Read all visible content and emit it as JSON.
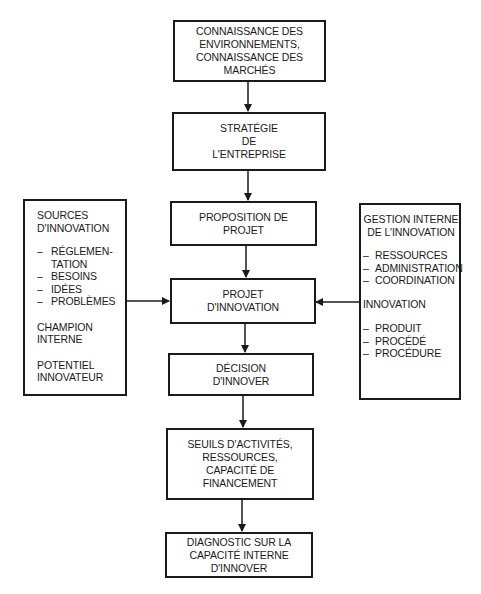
{
  "diagram": {
    "nodes": {
      "connaissance": {
        "lines": [
          "CONNAISSANCE DES",
          "ENVIRONNEMENTS,",
          "CONNAISSANCE DES",
          "MARCHÉS"
        ]
      },
      "strategie": {
        "lines": [
          "STRATÉGIE",
          "DE",
          "L'ENTREPRISE"
        ]
      },
      "proposition": {
        "lines": [
          "PROPOSITION DE",
          "PROJET"
        ]
      },
      "projet": {
        "lines": [
          "PROJET",
          "D'INNOVATION"
        ]
      },
      "decision": {
        "lines": [
          "DÉCISION",
          "D'INNOVER"
        ]
      },
      "seuils": {
        "lines": [
          "SEUILS D'ACTIVITÉS,",
          "RESSOURCES,",
          "CAPACITÉ DE",
          "FINANCEMENT"
        ]
      },
      "diagnostic": {
        "lines": [
          "DIAGNOSTIC SUR LA",
          "CAPACITÉ INTERNE",
          "D'INNOVER"
        ]
      },
      "sources": {
        "title": [
          "SOURCES",
          "D'INNOVATION"
        ],
        "items": [
          {
            "dash": "–",
            "text": "RÉGLEMEN-",
            "cont": "TATION"
          },
          {
            "dash": "–",
            "text": "BESOINS"
          },
          {
            "dash": "–",
            "text": "IDÉES"
          },
          {
            "dash": "–",
            "text": "PROBLÈMES"
          }
        ],
        "extra1": [
          "CHAMPION",
          "INTERNE"
        ],
        "extra2": [
          "POTENTIEL",
          "INNOVATEUR"
        ]
      },
      "gestion": {
        "title": [
          "GESTION INTERNE",
          "DE L'INNOVATION"
        ],
        "items": [
          {
            "dash": "–",
            "text": "RESSOURCES"
          },
          {
            "dash": "–",
            "text": "ADMINISTRATION"
          },
          {
            "dash": "–",
            "text": "COORDINATION"
          }
        ],
        "subtitle": "INNOVATION",
        "items2": [
          {
            "dash": "–",
            "text": "PRODUIT"
          },
          {
            "dash": "–",
            "text": "PROCÉDÉ"
          },
          {
            "dash": "–",
            "text": "PROCÉDURE"
          }
        ]
      }
    },
    "edges": [
      {
        "from": "connaissance",
        "to": "strategie"
      },
      {
        "from": "strategie",
        "to": "proposition"
      },
      {
        "from": "proposition",
        "to": "projet"
      },
      {
        "from": "sources",
        "to": "projet"
      },
      {
        "from": "gestion",
        "to": "projet"
      },
      {
        "from": "projet",
        "to": "decision"
      },
      {
        "from": "decision",
        "to": "seuils"
      },
      {
        "from": "seuils",
        "to": "diagnostic"
      }
    ],
    "colors": {
      "line": "#1a1a1a",
      "background": "#ffffff"
    }
  }
}
